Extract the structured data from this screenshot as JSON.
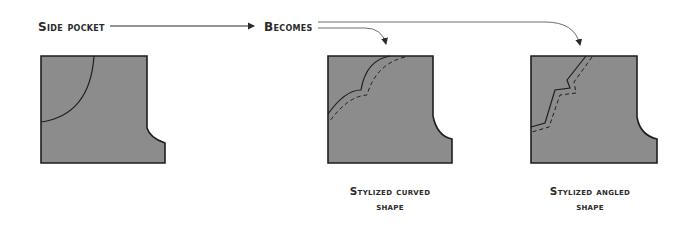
{
  "labels": {
    "source": "Side pocket",
    "becomes": "Becomes"
  },
  "captions": [
    {
      "line1": "Stylized curved",
      "line2": "shape"
    },
    {
      "line1": "Stylized angled",
      "line2": "shape"
    }
  ],
  "colors": {
    "fill": "#8c8c8c",
    "stroke": "#1e1e1e",
    "arrow": "#6e6e6e",
    "text": "#2a2a2a"
  }
}
